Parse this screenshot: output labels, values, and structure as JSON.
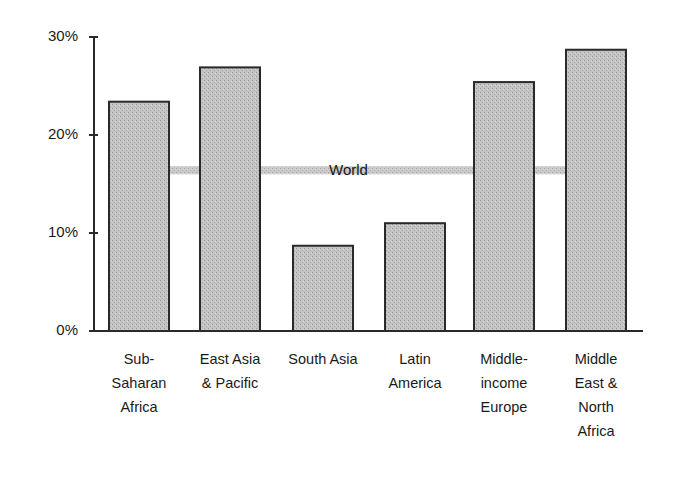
{
  "chart_data": {
    "type": "bar",
    "title": "",
    "xlabel": "",
    "ylabel": "",
    "ylim": [
      0,
      30
    ],
    "yticks": [
      "0%",
      "10%",
      "20%",
      "30%"
    ],
    "grid": false,
    "categories": [
      "Sub-Saharan Africa",
      "East Asia & Pacific",
      "South Asia",
      "Latin America",
      "Middle-income Europe",
      "Middle East & North Africa"
    ],
    "category_labels_display": [
      "Sub-\nSaharan\nAfrica",
      "East Asia\n& Pacific",
      "South Asia",
      "Latin\nAmerica",
      "Middle-\nincome\nEurope",
      "Middle\nEast &\nNorth\nAfrica"
    ],
    "values": [
      23.4,
      26.9,
      8.7,
      11.0,
      25.4,
      28.7
    ],
    "reference_line": {
      "label": "World",
      "value": 16.4
    },
    "colors": {
      "bar_fill": "#b9b9b9",
      "bar_edge": "#2a2a2a",
      "axis": "#2a2a2a",
      "world_line": "#bdbdbd"
    }
  }
}
